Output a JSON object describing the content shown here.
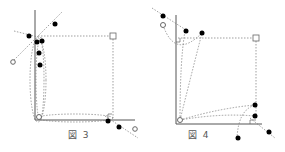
{
  "figures": [
    {
      "id": "fig3",
      "caption": "図  3"
    },
    {
      "id": "fig4",
      "caption": "図  4"
    }
  ],
  "colors": {
    "line": "#555555",
    "dash": "#777777",
    "dot": "#000000",
    "hollow": "#666666"
  }
}
